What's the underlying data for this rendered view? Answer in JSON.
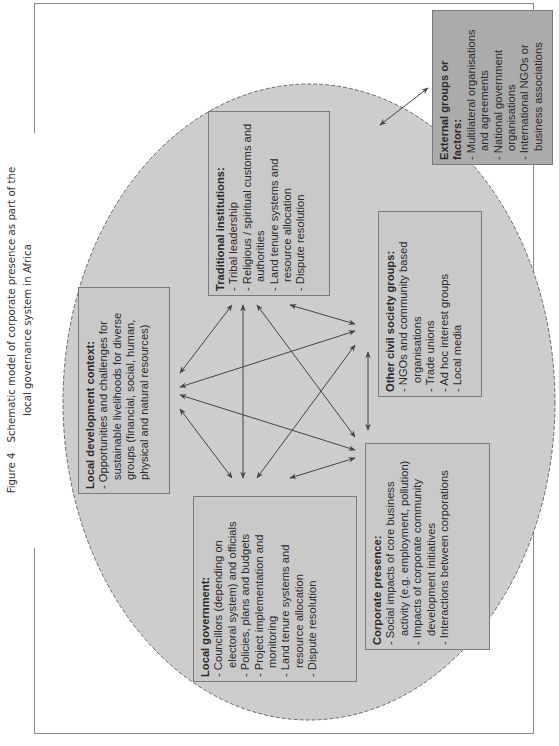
{
  "caption": {
    "figure_label": "Figure 4",
    "line1": "Schematic model of corporate presence as part of the",
    "line2": "local governance system in Africa"
  },
  "colors": {
    "ellipse_fill": "#cdcdcd",
    "ellipse_stroke": "#6a6a6a",
    "inner_box_fill": "#c9c9c9",
    "outer_box_fill": "#ababab",
    "arrow": "#444444",
    "frame": "#8a8a8a"
  },
  "boxes": {
    "local_development": {
      "title": "Local development context:",
      "items": [
        "Opportunities and challenges for sustainable livelihoods for diverse groups (financial, social, human, physical and natural resources)"
      ]
    },
    "traditional_institutions": {
      "title": "Traditional institutions:",
      "items": [
        "Tribal leadership",
        "Religious / spiritual customs and authorities",
        "Land tenure systems and resource allocation",
        "Dispute resolution"
      ]
    },
    "local_government": {
      "title": "Local government:",
      "items": [
        "Councillors (depending on electoral system) and officials",
        "Policies, plans and budgets",
        "Project implementation and monitoring",
        "Land tenure systems and resource allocation",
        "Dispute resolution"
      ]
    },
    "civil_society": {
      "title": "Other civil society groups:",
      "items": [
        "NGOs and community based organisations",
        "Trade unions",
        "Ad hoc interest groups",
        "Local media"
      ]
    },
    "corporate_presence": {
      "title": "Corporate presence:",
      "items": [
        "Social impacts of core business activity (e.g. employment, pollution)",
        "Impacts of corporate community development initiatives",
        "Interactions between corporations"
      ]
    },
    "external": {
      "title": "External groups or factors:",
      "items": [
        "Multilateral organisations and agreements",
        "National government organisations",
        "International NGOs or business associations"
      ]
    }
  },
  "arrows": [
    {
      "from": "traditional_institutions",
      "to": "local_development",
      "x1": 232,
      "y1": 305,
      "x2": 180,
      "y2": 373
    },
    {
      "from": "traditional_institutions",
      "to": "local_government",
      "x1": 243,
      "y1": 305,
      "x2": 243,
      "y2": 478
    },
    {
      "from": "traditional_institutions",
      "to": "corporate_presence",
      "x1": 257,
      "y1": 305,
      "x2": 355,
      "y2": 437
    },
    {
      "from": "traditional_institutions",
      "to": "civil_society",
      "x1": 290,
      "y1": 305,
      "x2": 355,
      "y2": 324
    },
    {
      "from": "local_development",
      "to": "civil_society",
      "x1": 180,
      "y1": 387,
      "x2": 355,
      "y2": 331
    },
    {
      "from": "local_development",
      "to": "corporate_presence",
      "x1": 180,
      "y1": 395,
      "x2": 355,
      "y2": 450
    },
    {
      "from": "local_development",
      "to": "local_government",
      "x1": 180,
      "y1": 409,
      "x2": 232,
      "y2": 478
    },
    {
      "from": "civil_society",
      "to": "local_government",
      "x1": 355,
      "y1": 345,
      "x2": 257,
      "y2": 478
    },
    {
      "from": "civil_society",
      "to": "corporate_presence",
      "x1": 368,
      "y1": 352,
      "x2": 368,
      "y2": 430
    },
    {
      "from": "corporate_presence",
      "to": "local_government",
      "x1": 290,
      "y1": 478,
      "x2": 355,
      "y2": 458
    },
    {
      "from": "ellipse",
      "to": "external",
      "x1": 380,
      "y1": 125,
      "x2": 428,
      "y2": 88
    }
  ]
}
